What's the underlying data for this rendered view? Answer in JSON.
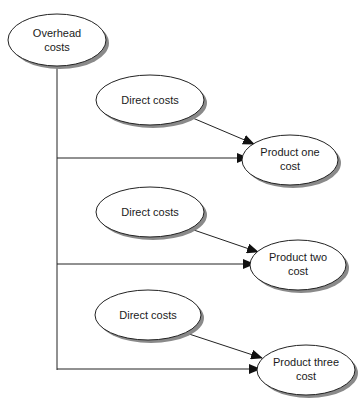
{
  "diagram": {
    "nodes": {
      "overhead": {
        "line1": "Overhead",
        "line2": "costs"
      },
      "direct1": {
        "label": "Direct costs"
      },
      "direct2": {
        "label": "Direct costs"
      },
      "direct3": {
        "label": "Direct costs"
      },
      "product1": {
        "line1": "Product one",
        "line2": "cost"
      },
      "product2": {
        "line1": "Product two",
        "line2": "cost"
      },
      "product3": {
        "line1": "Product three",
        "line2": "cost"
      }
    },
    "edges": [
      {
        "from": "overhead",
        "to": "product1"
      },
      {
        "from": "direct1",
        "to": "product1"
      },
      {
        "from": "overhead",
        "to": "product2"
      },
      {
        "from": "direct2",
        "to": "product2"
      },
      {
        "from": "overhead",
        "to": "product3"
      },
      {
        "from": "direct3",
        "to": "product3"
      }
    ]
  }
}
